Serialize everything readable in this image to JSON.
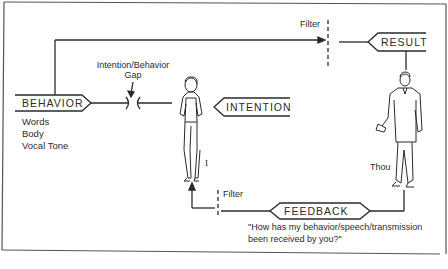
{
  "diagram": {
    "nodes": {
      "behavior": {
        "label": "BEHAVIOR",
        "sub_items": [
          "Words",
          "Body",
          "Vocal Tone"
        ]
      },
      "intention": {
        "label": "INTENTION"
      },
      "result": {
        "label": "RESULT"
      },
      "feedback": {
        "label": "FEEDBACK"
      }
    },
    "annotations": {
      "gap_label_line1": "Intention/Behavior",
      "gap_label_line2": "Gap",
      "filter_top": "Filter",
      "filter_bottom": "Filter",
      "self_label": "I",
      "other_label": "Thou",
      "feedback_question_line1": "\"How has my behavior/speech/transmission",
      "feedback_question_line2": "been received by you?\""
    },
    "figures": {
      "self": "woman-figure",
      "other": "man-figure"
    },
    "colors": {
      "line": "#2a2a2a",
      "frame": "#555555",
      "background": "#ffffff"
    }
  }
}
